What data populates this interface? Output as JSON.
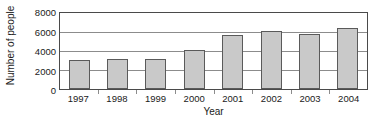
{
  "chart_data": {
    "type": "bar",
    "title": "",
    "xlabel": "Year",
    "ylabel": "Number of people",
    "categories": [
      "1997",
      "1998",
      "1999",
      "2000",
      "2001",
      "2002",
      "2003",
      "2004"
    ],
    "values": [
      3100,
      3150,
      3200,
      4100,
      5700,
      6100,
      5800,
      6400
    ],
    "ylim": [
      0,
      8000
    ],
    "yticks": [
      "0",
      "2000",
      "4000",
      "6000",
      "8000"
    ],
    "ytick_values": [
      0,
      2000,
      4000,
      6000,
      8000
    ],
    "grid": true,
    "legend": "none",
    "bar_color": "#c9c9c9",
    "bar_border_color": "#5a5a5a",
    "axis_color": "#4a4a4a",
    "grid_color": "#8c8c8c",
    "background": "#ffffff"
  }
}
